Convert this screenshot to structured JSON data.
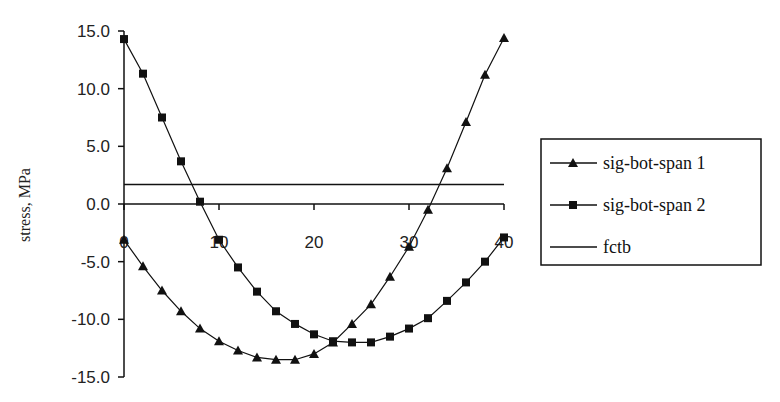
{
  "chart_data": {
    "type": "line",
    "title": "",
    "xlabel": "",
    "ylabel": "stress, MPa",
    "xlim": [
      0,
      40
    ],
    "ylim": [
      -15,
      15
    ],
    "x_ticks": [
      0,
      10,
      20,
      30,
      40
    ],
    "x_tick_labels": [
      "0",
      "10",
      "20",
      "30",
      "40"
    ],
    "y_ticks": [
      15,
      10,
      5,
      0,
      -5,
      -10,
      -15
    ],
    "y_tick_labels": [
      "15.0",
      "10.0",
      "5.0",
      "0.0",
      "-5.0",
      "-10.0",
      "-15.0"
    ],
    "grid": false,
    "legend_position": "right",
    "x": [
      0,
      2,
      4,
      6,
      8,
      10,
      12,
      14,
      16,
      18,
      20,
      22,
      24,
      26,
      28,
      30,
      32,
      34,
      36,
      38,
      40
    ],
    "series": [
      {
        "name": "sig-bot-span 1",
        "marker": "triangle",
        "values": [
          -3.1,
          -5.4,
          -7.5,
          -9.3,
          -10.8,
          -11.9,
          -12.7,
          -13.3,
          -13.5,
          -13.5,
          -13.0,
          -12.0,
          -10.4,
          -8.7,
          -6.3,
          -3.7,
          -0.5,
          3.1,
          7.1,
          11.2,
          14.4
        ]
      },
      {
        "name": "sig-bot-span 2",
        "marker": "square",
        "values": [
          14.3,
          11.3,
          7.5,
          3.7,
          0.2,
          -3.1,
          -5.5,
          -7.6,
          -9.3,
          -10.4,
          -11.3,
          -11.9,
          -12.0,
          -12.0,
          -11.5,
          -10.8,
          -9.9,
          -8.4,
          -6.8,
          -5.0,
          -2.9
        ]
      },
      {
        "name": "fctb",
        "marker": "none",
        "values": [
          1.7,
          1.7,
          1.7,
          1.7,
          1.7,
          1.7,
          1.7,
          1.7,
          1.7,
          1.7,
          1.7,
          1.7,
          1.7,
          1.7,
          1.7,
          1.7,
          1.7,
          1.7,
          1.7,
          1.7,
          1.7
        ]
      }
    ],
    "colors": {
      "line": "#111111",
      "axis": "#111111",
      "background": "#ffffff"
    }
  }
}
